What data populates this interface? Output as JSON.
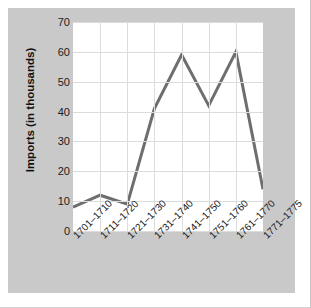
{
  "chart_data": {
    "type": "line",
    "title": "",
    "xlabel": "",
    "ylabel": "Imports (in thousands)",
    "categories": [
      "1701–1710",
      "1711–1720",
      "1721–1730",
      "1731–1740",
      "1741–1750",
      "1751–1760",
      "1761–1770",
      "1771–1775"
    ],
    "values": [
      8,
      12,
      9,
      41,
      59,
      42,
      60,
      14
    ],
    "ylim": [
      0,
      70
    ],
    "yticks": [
      0,
      10,
      20,
      30,
      40,
      50,
      60,
      70
    ],
    "ytick_labels": [
      "0",
      "10",
      "20",
      "30",
      "40",
      "50",
      "60",
      "70"
    ],
    "grid": true,
    "legend": "none",
    "series": [
      {
        "name": "Imports",
        "color": "#6e6e6e",
        "values": [
          8,
          12,
          9,
          41,
          59,
          42,
          60,
          14
        ]
      }
    ],
    "colors": {
      "line": "#6e6e6e",
      "panel_background": "#c9c9c9",
      "plot_background": "#ffffff",
      "gridline": "#dcdcdc",
      "text": "#1c1c1c"
    }
  }
}
